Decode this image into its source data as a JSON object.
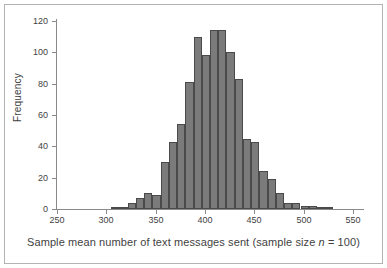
{
  "figure": {
    "background_color": "#ffffff",
    "border_color": "#b3b3b3",
    "axis_color": "#8a8a8a",
    "bar_fill_color": "#7b7b7b",
    "bar_edge_color": "#4a4a4a",
    "text_color": "#3f3f3f"
  },
  "axis_titles": {
    "x_prefix": "Sample mean number of text messages sent (sample size ",
    "x_italic": "n",
    "x_suffix": " = 100)",
    "y": "Frequency"
  },
  "chart_data": {
    "type": "bar",
    "title": "",
    "xlabel": "Sample mean number of text messages sent (sample size n = 100)",
    "ylabel": "Frequency",
    "xlim": [
      250,
      560
    ],
    "ylim": [
      0,
      120
    ],
    "grid": false,
    "legend": null,
    "bin_width": 8.33,
    "x_ticks": [
      250,
      300,
      350,
      400,
      450,
      500,
      550
    ],
    "y_ticks": [
      0,
      20,
      40,
      60,
      80,
      100,
      120
    ],
    "x_tick_labels": [
      "250",
      "300",
      "350",
      "400",
      "450",
      "500",
      "550"
    ],
    "y_tick_labels": [
      "0",
      "20",
      "40",
      "60",
      "80",
      "100",
      "120"
    ],
    "bin_starts": [
      305.0,
      313.3,
      321.7,
      330.0,
      338.3,
      346.7,
      355.0,
      363.3,
      371.7,
      380.0,
      388.3,
      396.7,
      405.0,
      413.3,
      421.7,
      430.0,
      438.3,
      446.7,
      455.0,
      463.3,
      471.7,
      480.0,
      488.3,
      496.7,
      505.0,
      513.3,
      521.7,
      530.0,
      538.3,
      546.7
    ],
    "bin_centers": [
      309,
      317,
      326,
      334,
      342,
      351,
      359,
      368,
      376,
      384,
      393,
      401,
      409,
      418,
      426,
      434,
      443,
      451,
      459,
      468,
      476,
      484,
      493,
      501,
      509,
      518,
      526,
      534,
      543,
      551
    ],
    "values": [
      1,
      1,
      4,
      7,
      10,
      9,
      30,
      43,
      54,
      81,
      110,
      98,
      114,
      114,
      100,
      83,
      45,
      43,
      24,
      19,
      10,
      4,
      4,
      2,
      2,
      1,
      1,
      0,
      0,
      0
    ],
    "categories": [
      "309",
      "317",
      "326",
      "334",
      "342",
      "351",
      "359",
      "368",
      "376",
      "384",
      "393",
      "401",
      "409",
      "418",
      "426",
      "434",
      "443",
      "451",
      "459",
      "468",
      "476",
      "484",
      "493",
      "501",
      "509",
      "518",
      "526",
      "534",
      "543",
      "551"
    ]
  }
}
